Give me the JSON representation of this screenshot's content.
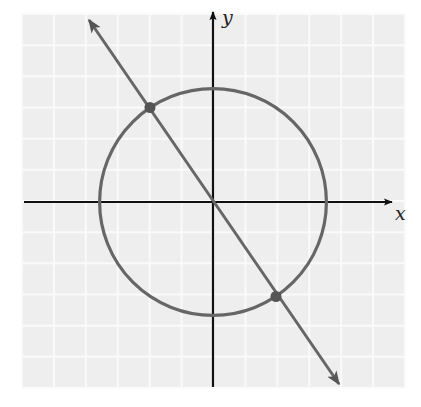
{
  "figure": {
    "type": "coordinate-plane-diagram",
    "axes": {
      "x_label": "x",
      "y_label": "y"
    },
    "grid": {
      "cells_x": 12,
      "cells_y": 12,
      "unit_px": 31.5,
      "background_color": "#eeeeee",
      "line_color": "#fafafa"
    },
    "colors": {
      "axis": "#111111",
      "curve": "#666666",
      "point": "#555555"
    },
    "circle": {
      "center": [
        0,
        0
      ],
      "radius_units": 3.6
    },
    "line": {
      "slope": -1.5,
      "intercept": 0,
      "arrows": "both"
    },
    "intersection_points": [
      {
        "x": -2,
        "y": 3
      },
      {
        "x": 2,
        "y": -3
      }
    ]
  }
}
